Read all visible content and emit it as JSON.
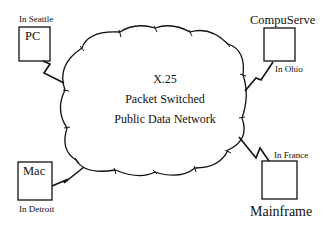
{
  "network": {
    "line1": "X.25",
    "line2": "Packet Switched",
    "line3": "Public Data Network"
  },
  "nodes": [
    {
      "id": "pc",
      "name": "PC",
      "location": "In Seattle"
    },
    {
      "id": "compuserve",
      "name": "CompuServe",
      "location": "In Ohio"
    },
    {
      "id": "mac",
      "name": "Mac",
      "location": "In Detroit"
    },
    {
      "id": "mainframe",
      "name": "Mainframe",
      "location": "In France"
    }
  ],
  "colors": {
    "stroke": "#111111",
    "background": "#ffffff"
  }
}
